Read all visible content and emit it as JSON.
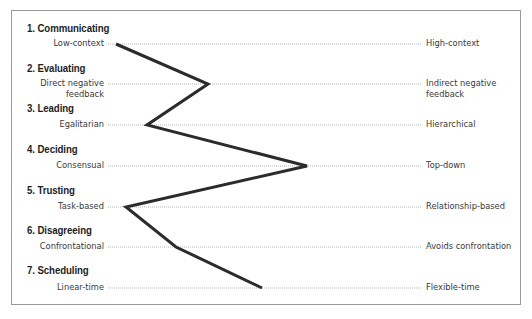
{
  "diagram": {
    "type": "culture-map-profile",
    "frame_color": "#9a9a9a",
    "line_color": "#2b2b2b",
    "scale_line_color": "#8a8a8a",
    "scales": [
      {
        "number": "1.",
        "title": "1.  Communicating",
        "left_label": "Low-context",
        "right_label": "High-context",
        "position_x": 116
      },
      {
        "number": "2.",
        "title": "2.  Evaluating",
        "left_label": "Direct negative\nfeedback",
        "left_label_line1": "Direct negative",
        "left_label_line2": "feedback",
        "right_label": "Indirect negative\nfeedback",
        "right_label_line1": "Indirect negative",
        "right_label_line2": "feedback",
        "position_x": 208
      },
      {
        "number": "3.",
        "title": "3.  Leading",
        "left_label": "Egalitarian",
        "right_label": "Hierarchical",
        "position_x": 147
      },
      {
        "number": "4.",
        "title": "4.  Deciding",
        "left_label": "Consensual",
        "right_label": "Top-down",
        "position_x": 307
      },
      {
        "number": "5.",
        "title": "5.  Trusting",
        "left_label": "Task-based",
        "right_label": "Relationship-based",
        "position_x": 126
      },
      {
        "number": "6.",
        "title": "6.  Disagreeing",
        "left_label": "Confrontational",
        "right_label": "Avoids confrontation",
        "position_x": 176
      },
      {
        "number": "7.",
        "title": "7.  Scheduling",
        "left_label": "Linear-time",
        "right_label": "Flexible-time",
        "position_x": 262
      }
    ]
  }
}
